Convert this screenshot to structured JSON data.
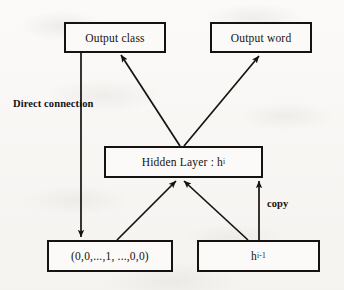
{
  "diagram": {
    "nodes": [
      {
        "id": "output-class",
        "label": "Output class"
      },
      {
        "id": "output-word",
        "label": "Output word"
      },
      {
        "id": "hidden-layer",
        "label": "Hidden Layer : h",
        "superscript": "i"
      },
      {
        "id": "input-onehot",
        "label": "(0,0,...,1, ...,0,0)"
      },
      {
        "id": "prev-hidden",
        "label": "h",
        "superscript": "i-1"
      }
    ],
    "edge_labels": {
      "direct_connection": "Direct connection",
      "copy": "copy"
    },
    "colors": {
      "stroke": "#16120f",
      "box_fill": "#fbfaf8",
      "background": "#f7f6f4"
    }
  }
}
